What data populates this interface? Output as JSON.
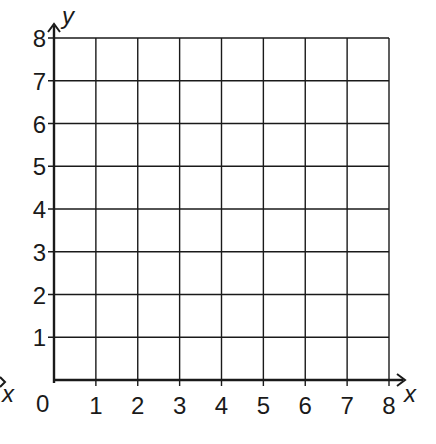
{
  "grid": {
    "x_min": 0,
    "x_max": 8,
    "y_min": 0,
    "y_max": 8,
    "x_ticks": [
      "1",
      "2",
      "3",
      "4",
      "5",
      "6",
      "7",
      "8"
    ],
    "y_ticks": [
      "1",
      "2",
      "3",
      "4",
      "5",
      "6",
      "7",
      "8"
    ],
    "origin_label": "0",
    "x_axis_label": "x",
    "y_axis_label": "y",
    "left_edge_x_label": "x",
    "line_color": "#1a1a1a",
    "background": "#ffffff"
  },
  "chart_data": {
    "type": "scatter",
    "title": "",
    "xlabel": "x",
    "ylabel": "y",
    "xlim": [
      0,
      8
    ],
    "ylim": [
      0,
      8
    ],
    "x_tick_labels": [
      "0",
      "1",
      "2",
      "3",
      "4",
      "5",
      "6",
      "7",
      "8"
    ],
    "y_tick_labels": [
      "1",
      "2",
      "3",
      "4",
      "5",
      "6",
      "7",
      "8"
    ],
    "grid": true,
    "series": []
  }
}
